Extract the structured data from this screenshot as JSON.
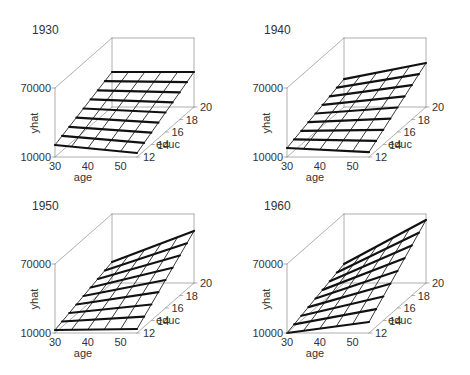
{
  "chart_data": [
    {
      "type": "surface",
      "title": "1930",
      "xlabel": "age",
      "ylabel": "educ",
      "zlabel": "yhat",
      "x_ticks": [
        30,
        40,
        50
      ],
      "y_ticks": [
        12,
        14,
        16,
        18,
        20
      ],
      "z_ticks": [
        10000,
        70000
      ],
      "xlim": [
        30,
        55
      ],
      "ylim": [
        12,
        20
      ],
      "zlim": [
        10000,
        70000
      ],
      "corners": {
        "age30_educ12": 20400,
        "age55_educ12": 13500,
        "age30_educ20": 40400,
        "age55_educ20": 40400
      }
    },
    {
      "type": "surface",
      "title": "1940",
      "xlabel": "age",
      "ylabel": "educ",
      "zlabel": "yhat",
      "x_ticks": [
        30,
        40,
        50
      ],
      "y_ticks": [
        12,
        14,
        16,
        18,
        20
      ],
      "z_ticks": [
        10000,
        70000
      ],
      "xlim": [
        30,
        55
      ],
      "ylim": [
        12,
        20
      ],
      "zlim": [
        10000,
        70000
      ],
      "corners": {
        "age30_educ12": 17800,
        "age55_educ12": 14300,
        "age30_educ20": 34300,
        "age55_educ20": 48300
      }
    },
    {
      "type": "surface",
      "title": "1950",
      "xlabel": "age",
      "ylabel": "educ",
      "zlabel": "yhat",
      "x_ticks": [
        30,
        40,
        50
      ],
      "y_ticks": [
        12,
        14,
        16,
        18,
        20
      ],
      "z_ticks": [
        10000,
        70000
      ],
      "xlim": [
        30,
        55
      ],
      "ylim": [
        12,
        20
      ],
      "zlim": [
        10000,
        70000
      ],
      "corners": {
        "age30_educ12": 12600,
        "age55_educ12": 13500,
        "age30_educ20": 28300,
        "age55_educ20": 55200
      }
    },
    {
      "type": "surface",
      "title": "1960",
      "xlabel": "age",
      "ylabel": "educ",
      "zlabel": "yhat",
      "x_ticks": [
        30,
        40,
        50
      ],
      "y_ticks": [
        12,
        14,
        16,
        18,
        20
      ],
      "z_ticks": [
        10000,
        70000
      ],
      "xlim": [
        30,
        55
      ],
      "ylim": [
        12,
        20
      ],
      "zlim": [
        10000,
        70000
      ],
      "corners": {
        "age30_educ12": 10000,
        "age55_educ12": 19600,
        "age30_educ20": 26500,
        "age55_educ20": 64800
      }
    }
  ],
  "panels": [
    {
      "title": "1930",
      "xlabel": "age",
      "ylabel": "educ",
      "zlabel": "yhat",
      "z_top": "70000",
      "z_bottom": "10000",
      "x_ticks": [
        "30",
        "40",
        "50"
      ],
      "y_ticks": [
        "12",
        "14",
        "16",
        "18",
        "20"
      ]
    },
    {
      "title": "1940",
      "xlabel": "age",
      "ylabel": "educ",
      "zlabel": "yhat",
      "z_top": "70000",
      "z_bottom": "10000",
      "x_ticks": [
        "30",
        "40",
        "50"
      ],
      "y_ticks": [
        "12",
        "14",
        "16",
        "18",
        "20"
      ]
    },
    {
      "title": "1950",
      "xlabel": "age",
      "ylabel": "educ",
      "zlabel": "yhat",
      "z_top": "70000",
      "z_bottom": "10000",
      "x_ticks": [
        "30",
        "40",
        "50"
      ],
      "y_ticks": [
        "12",
        "14",
        "16",
        "18",
        "20"
      ]
    },
    {
      "title": "1960",
      "xlabel": "age",
      "ylabel": "educ",
      "zlabel": "yhat",
      "z_top": "70000",
      "z_bottom": "10000",
      "x_ticks": [
        "30",
        "40",
        "50"
      ],
      "y_ticks": [
        "12",
        "14",
        "16",
        "18",
        "20"
      ]
    }
  ],
  "colors": {
    "box": "#9a9a9a",
    "grid_thin": "#222222",
    "grid_thick": "#111111",
    "text": "#333333"
  }
}
